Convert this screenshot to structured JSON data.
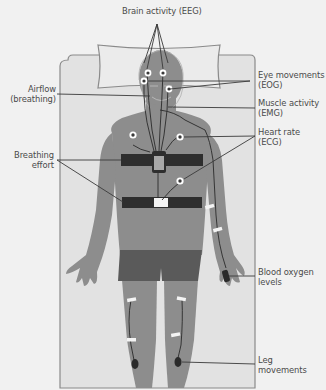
{
  "diagram": {
    "type": "anatomical-illustration",
    "colors": {
      "background": "#f1f1f1",
      "bed": "#e2e2e2",
      "pillow": "#e9e9e9",
      "outline": "#8a8a8a",
      "skin": "#8d8d8d",
      "shorts": "#5a5a5a",
      "belt": "#2e2e2e",
      "wire": "#2a2a2a",
      "sensor_pad": "#ffffff",
      "label_text": "#4a4a4a",
      "leader_line": "#3a3a3a"
    },
    "labels": {
      "eeg": "Brain activity (EEG)",
      "airflow": "Airflow\n(breathing)",
      "eog": "Eye movements\n(EOG)",
      "emg": "Muscle activity\n(EMG)",
      "ecg": "Heart rate\n(ECG)",
      "breathing_effort": "Breathing\neffort",
      "blood_oxygen": "Blood oxygen\nlevels",
      "leg_movements": "Leg\nmovements"
    }
  }
}
